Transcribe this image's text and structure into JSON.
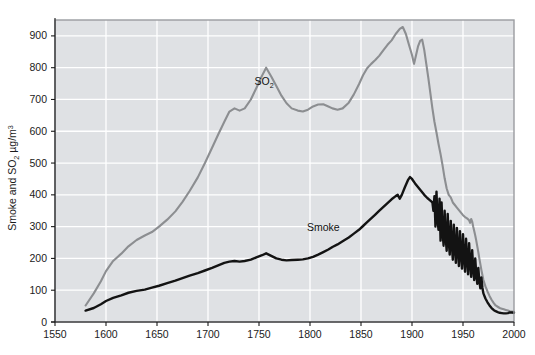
{
  "chart_data": {
    "type": "line",
    "title": "",
    "subtitle": "",
    "xlabel": "",
    "ylabel": "Smoke and SO2 ug/m3",
    "ylabel_parts": {
      "main": "Smoke and SO",
      "sub": "2",
      "units_pre": " µg/m",
      "units_sup": "3"
    },
    "xlim": [
      1550,
      2000
    ],
    "ylim": [
      0,
      950
    ],
    "xticks": [
      1550,
      1600,
      1650,
      1700,
      1750,
      1800,
      1850,
      1900,
      1950,
      2000
    ],
    "xtick_labels": [
      "1550",
      "1600",
      "1650",
      "1700",
      "1750",
      "1800",
      "1850",
      "1900",
      "1950",
      "2000"
    ],
    "yticks": [
      0,
      100,
      200,
      300,
      400,
      500,
      600,
      700,
      800,
      900
    ],
    "ytick_labels": [
      "0",
      "100",
      "200",
      "300",
      "400",
      "500",
      "600",
      "700",
      "800",
      "900"
    ],
    "grid": true,
    "grid_color": "#ffffff",
    "plot_bgcolor": "#dfe1e4",
    "legend_position": "inline-annotations",
    "annotations": [
      {
        "text": "SO2",
        "text_main": "SO",
        "text_sub": "2",
        "x": 1755,
        "y": 745
      },
      {
        "text": "Smoke",
        "x": 1813,
        "y": 285
      }
    ],
    "series": [
      {
        "name": "SO2",
        "color": "#8c8e91",
        "width": 2.1,
        "points": [
          [
            1580,
            52
          ],
          [
            1588,
            90
          ],
          [
            1595,
            128
          ],
          [
            1600,
            160
          ],
          [
            1607,
            192
          ],
          [
            1615,
            215
          ],
          [
            1622,
            238
          ],
          [
            1630,
            258
          ],
          [
            1638,
            272
          ],
          [
            1645,
            283
          ],
          [
            1652,
            300
          ],
          [
            1660,
            322
          ],
          [
            1668,
            348
          ],
          [
            1675,
            378
          ],
          [
            1682,
            412
          ],
          [
            1690,
            455
          ],
          [
            1697,
            500
          ],
          [
            1704,
            548
          ],
          [
            1710,
            590
          ],
          [
            1716,
            630
          ],
          [
            1721,
            662
          ],
          [
            1726,
            672
          ],
          [
            1731,
            665
          ],
          [
            1736,
            672
          ],
          [
            1742,
            700
          ],
          [
            1748,
            740
          ],
          [
            1753,
            775
          ],
          [
            1757,
            800
          ],
          [
            1762,
            772
          ],
          [
            1767,
            742
          ],
          [
            1772,
            712
          ],
          [
            1777,
            688
          ],
          [
            1782,
            672
          ],
          [
            1788,
            665
          ],
          [
            1793,
            662
          ],
          [
            1798,
            668
          ],
          [
            1803,
            678
          ],
          [
            1808,
            684
          ],
          [
            1813,
            685
          ],
          [
            1818,
            678
          ],
          [
            1822,
            672
          ],
          [
            1827,
            668
          ],
          [
            1832,
            672
          ],
          [
            1838,
            690
          ],
          [
            1843,
            716
          ],
          [
            1848,
            748
          ],
          [
            1852,
            776
          ],
          [
            1856,
            798
          ],
          [
            1860,
            812
          ],
          [
            1864,
            824
          ],
          [
            1868,
            838
          ],
          [
            1872,
            855
          ],
          [
            1876,
            872
          ],
          [
            1880,
            886
          ],
          [
            1884,
            906
          ],
          [
            1888,
            922
          ],
          [
            1891,
            928
          ],
          [
            1894,
            906
          ],
          [
            1897,
            872
          ],
          [
            1900,
            840
          ],
          [
            1902,
            812
          ],
          [
            1904,
            840
          ],
          [
            1906,
            868
          ],
          [
            1908,
            884
          ],
          [
            1910,
            888
          ],
          [
            1912,
            856
          ],
          [
            1914,
            812
          ],
          [
            1916,
            768
          ],
          [
            1918,
            720
          ],
          [
            1920,
            672
          ],
          [
            1922,
            630
          ],
          [
            1924,
            596
          ],
          [
            1926,
            560
          ],
          [
            1928,
            528
          ],
          [
            1930,
            492
          ],
          [
            1932,
            452
          ],
          [
            1934,
            420
          ],
          [
            1936,
            400
          ],
          [
            1938,
            392
          ],
          [
            1940,
            376
          ],
          [
            1942,
            368
          ],
          [
            1944,
            360
          ],
          [
            1946,
            352
          ],
          [
            1948,
            344
          ],
          [
            1950,
            336
          ],
          [
            1952,
            330
          ],
          [
            1954,
            326
          ],
          [
            1956,
            320
          ],
          [
            1957,
            312
          ],
          [
            1958,
            324
          ],
          [
            1959,
            316
          ],
          [
            1960,
            300
          ],
          [
            1961,
            286
          ],
          [
            1962,
            272
          ],
          [
            1963,
            256
          ],
          [
            1964,
            238
          ],
          [
            1965,
            220
          ],
          [
            1966,
            200
          ],
          [
            1967,
            182
          ],
          [
            1968,
            164
          ],
          [
            1969,
            148
          ],
          [
            1970,
            132
          ],
          [
            1972,
            112
          ],
          [
            1974,
            96
          ],
          [
            1976,
            82
          ],
          [
            1978,
            70
          ],
          [
            1980,
            60
          ],
          [
            1982,
            52
          ],
          [
            1984,
            48
          ],
          [
            1986,
            44
          ],
          [
            1988,
            42
          ],
          [
            1990,
            40
          ],
          [
            1992,
            38
          ],
          [
            1994,
            36
          ],
          [
            1996,
            34
          ],
          [
            1998,
            33
          ],
          [
            2000,
            32
          ]
        ]
      },
      {
        "name": "Smoke",
        "color": "#131313",
        "width": 2.4,
        "points": [
          [
            1580,
            36
          ],
          [
            1588,
            44
          ],
          [
            1595,
            56
          ],
          [
            1600,
            66
          ],
          [
            1607,
            76
          ],
          [
            1615,
            84
          ],
          [
            1622,
            92
          ],
          [
            1630,
            98
          ],
          [
            1638,
            102
          ],
          [
            1645,
            108
          ],
          [
            1652,
            114
          ],
          [
            1660,
            122
          ],
          [
            1668,
            130
          ],
          [
            1675,
            138
          ],
          [
            1682,
            146
          ],
          [
            1690,
            154
          ],
          [
            1697,
            162
          ],
          [
            1704,
            170
          ],
          [
            1710,
            178
          ],
          [
            1716,
            186
          ],
          [
            1721,
            190
          ],
          [
            1726,
            192
          ],
          [
            1731,
            190
          ],
          [
            1736,
            192
          ],
          [
            1742,
            196
          ],
          [
            1748,
            204
          ],
          [
            1753,
            210
          ],
          [
            1757,
            216
          ],
          [
            1762,
            208
          ],
          [
            1767,
            200
          ],
          [
            1772,
            196
          ],
          [
            1777,
            194
          ],
          [
            1782,
            195
          ],
          [
            1788,
            196
          ],
          [
            1793,
            197
          ],
          [
            1798,
            200
          ],
          [
            1803,
            205
          ],
          [
            1808,
            212
          ],
          [
            1813,
            220
          ],
          [
            1818,
            228
          ],
          [
            1822,
            236
          ],
          [
            1827,
            244
          ],
          [
            1832,
            254
          ],
          [
            1838,
            266
          ],
          [
            1843,
            278
          ],
          [
            1848,
            290
          ],
          [
            1852,
            302
          ],
          [
            1856,
            314
          ],
          [
            1860,
            326
          ],
          [
            1864,
            338
          ],
          [
            1868,
            350
          ],
          [
            1872,
            362
          ],
          [
            1876,
            374
          ],
          [
            1880,
            386
          ],
          [
            1884,
            396
          ],
          [
            1886,
            400
          ],
          [
            1888,
            388
          ],
          [
            1890,
            400
          ],
          [
            1893,
            424
          ],
          [
            1896,
            446
          ],
          [
            1898,
            456
          ],
          [
            1900,
            450
          ],
          [
            1903,
            436
          ],
          [
            1906,
            424
          ],
          [
            1909,
            412
          ],
          [
            1912,
            400
          ],
          [
            1915,
            390
          ],
          [
            1918,
            382
          ],
          [
            1920,
            376
          ],
          [
            1921,
            350
          ],
          [
            1922,
            396
          ],
          [
            1923,
            300
          ],
          [
            1924,
            410
          ],
          [
            1925,
            322
          ],
          [
            1926,
            290
          ],
          [
            1927,
            388
          ],
          [
            1928,
            256
          ],
          [
            1929,
            376
          ],
          [
            1930,
            282
          ],
          [
            1931,
            240
          ],
          [
            1932,
            350
          ],
          [
            1933,
            268
          ],
          [
            1934,
            224
          ],
          [
            1935,
            340
          ],
          [
            1936,
            256
          ],
          [
            1937,
            212
          ],
          [
            1938,
            318
          ],
          [
            1939,
            246
          ],
          [
            1940,
            196
          ],
          [
            1941,
            306
          ],
          [
            1942,
            234
          ],
          [
            1943,
            186
          ],
          [
            1944,
            296
          ],
          [
            1945,
            226
          ],
          [
            1946,
            176
          ],
          [
            1947,
            286
          ],
          [
            1948,
            214
          ],
          [
            1949,
            168
          ],
          [
            1950,
            276
          ],
          [
            1951,
            206
          ],
          [
            1952,
            158
          ],
          [
            1953,
            262
          ],
          [
            1954,
            198
          ],
          [
            1955,
            150
          ],
          [
            1956,
            248
          ],
          [
            1957,
            186
          ],
          [
            1958,
            142
          ],
          [
            1959,
            226
          ],
          [
            1960,
            170
          ],
          [
            1961,
            132
          ],
          [
            1962,
            200
          ],
          [
            1963,
            150
          ],
          [
            1964,
            120
          ],
          [
            1965,
            170
          ],
          [
            1966,
            130
          ],
          [
            1967,
            106
          ],
          [
            1968,
            140
          ],
          [
            1969,
            108
          ],
          [
            1970,
            90
          ],
          [
            1972,
            74
          ],
          [
            1974,
            62
          ],
          [
            1976,
            52
          ],
          [
            1978,
            44
          ],
          [
            1980,
            38
          ],
          [
            1982,
            34
          ],
          [
            1984,
            31
          ],
          [
            1986,
            29
          ],
          [
            1988,
            28
          ],
          [
            1990,
            27
          ],
          [
            1992,
            27
          ],
          [
            1994,
            28
          ],
          [
            1996,
            30
          ],
          [
            1998,
            30
          ],
          [
            2000,
            29
          ]
        ]
      }
    ]
  }
}
